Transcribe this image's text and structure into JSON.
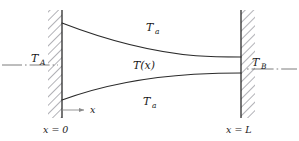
{
  "figure": {
    "colors": {
      "line": "#2b2b2b",
      "hatch": "#55555f",
      "centerline": "#6d6d6d",
      "axis": "#8a8a8a",
      "text": "#1a1a1a",
      "background": "#ffffff"
    },
    "labels": {
      "temp_left": {
        "base": "T",
        "sub": "A"
      },
      "temp_right": {
        "base": "T",
        "sub": "B"
      },
      "temp_profile": "T(x)",
      "temp_ambient_top": {
        "base": "T",
        "sub": "a"
      },
      "temp_ambient_bottom": {
        "base": "T",
        "sub": "a"
      },
      "axis_x": "x",
      "position_left": "x = 0",
      "position_right": "x = L"
    },
    "geometry": {
      "wall_left_x": 62,
      "wall_right_x": 241,
      "wall_top_y": 10,
      "wall_bottom_y": 118,
      "curve_upper_start_y": 23,
      "curve_upper_end_y": 57,
      "curve_lower_start_y": 100,
      "curve_lower_end_y": 73,
      "axis_baseline_y": 110,
      "centerline_left_y": 65,
      "centerline_right_y": 69
    }
  }
}
